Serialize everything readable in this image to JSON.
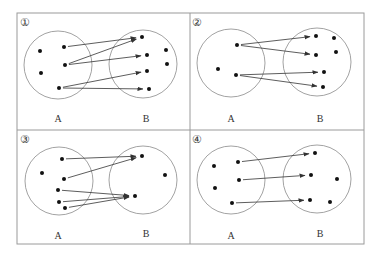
{
  "colors": {
    "frame": "#9a9a9a",
    "circle": "#8a8a8a",
    "dot": "#111111",
    "arrow": "#333333",
    "text": "#333333"
  },
  "frame": {
    "x": 17,
    "y": 13,
    "width": 347,
    "height": 231,
    "divider_x": 190,
    "divider_y": 130
  },
  "panels": [
    {
      "id": "panel-1",
      "number": "①",
      "number_pos": [
        25,
        23
      ],
      "set_a": {
        "label": "A",
        "label_pos": [
          58,
          120
        ],
        "circle": [
          58,
          65,
          34
        ],
        "points": [
          [
            40,
            51
          ],
          [
            64,
            47
          ],
          [
            41,
            73
          ],
          [
            65,
            65
          ],
          [
            59,
            88
          ]
        ]
      },
      "set_b": {
        "label": "B",
        "label_pos": [
          146,
          120
        ],
        "circle": [
          143,
          64,
          34
        ],
        "points": [
          [
            142,
            37
          ],
          [
            147,
            55
          ],
          [
            166,
            50
          ],
          [
            167,
            64
          ],
          [
            147,
            71
          ],
          [
            149,
            89
          ]
        ]
      },
      "arrows": [
        {
          "from": [
            64,
            47
          ],
          "to": [
            142,
            37
          ]
        },
        {
          "from": [
            65,
            65
          ],
          "to": [
            142,
            37
          ]
        },
        {
          "from": [
            65,
            65
          ],
          "to": [
            147,
            55
          ]
        },
        {
          "from": [
            59,
            88
          ],
          "to": [
            147,
            71
          ]
        },
        {
          "from": [
            59,
            88
          ],
          "to": [
            149,
            89
          ]
        }
      ]
    },
    {
      "id": "panel-2",
      "number": "②",
      "number_pos": [
        197,
        23
      ],
      "set_a": {
        "label": "A",
        "label_pos": [
          231,
          120
        ],
        "circle": [
          231,
          63,
          34
        ],
        "points": [
          [
            237,
            45
          ],
          [
            218,
            69
          ],
          [
            236,
            75
          ]
        ]
      },
      "set_b": {
        "label": "B",
        "label_pos": [
          320,
          120
        ],
        "circle": [
          317,
          62,
          34
        ],
        "points": [
          [
            316,
            36
          ],
          [
            334,
            38
          ],
          [
            336,
            52
          ],
          [
            316,
            55
          ],
          [
            324,
            72
          ],
          [
            323,
            87
          ]
        ]
      },
      "arrows": [
        {
          "from": [
            237,
            45
          ],
          "to": [
            316,
            36
          ]
        },
        {
          "from": [
            237,
            45
          ],
          "to": [
            316,
            55
          ]
        },
        {
          "from": [
            236,
            75
          ],
          "to": [
            324,
            72
          ]
        },
        {
          "from": [
            236,
            75
          ],
          "to": [
            323,
            87
          ]
        }
      ]
    },
    {
      "id": "panel-3",
      "number": "③",
      "number_pos": [
        25,
        140
      ],
      "set_a": {
        "label": "A",
        "label_pos": [
          58,
          237
        ],
        "circle": [
          59,
          181,
          34
        ],
        "points": [
          [
            62,
            159
          ],
          [
            42,
            173
          ],
          [
            64,
            179
          ],
          [
            58,
            190
          ],
          [
            59,
            202
          ],
          [
            65,
            208
          ]
        ]
      },
      "set_b": {
        "label": "B",
        "label_pos": [
          146,
          235
        ],
        "circle": [
          143,
          180,
          34
        ],
        "points": [
          [
            142,
            156
          ],
          [
            165,
            175
          ],
          [
            135,
            196
          ]
        ]
      },
      "arrows": [
        {
          "from": [
            62,
            159
          ],
          "to": [
            142,
            156
          ]
        },
        {
          "from": [
            64,
            179
          ],
          "to": [
            142,
            156
          ]
        },
        {
          "from": [
            58,
            190
          ],
          "to": [
            135,
            196
          ]
        },
        {
          "from": [
            59,
            202
          ],
          "to": [
            135,
            196
          ]
        },
        {
          "from": [
            65,
            208
          ],
          "to": [
            135,
            196
          ]
        }
      ]
    },
    {
      "id": "panel-4",
      "number": "④",
      "number_pos": [
        197,
        140
      ],
      "set_a": {
        "label": "A",
        "label_pos": [
          231,
          237
        ],
        "circle": [
          231,
          180,
          34
        ],
        "points": [
          [
            214,
            166
          ],
          [
            238,
            162
          ],
          [
            215,
            188
          ],
          [
            239,
            180
          ],
          [
            232,
            203
          ]
        ]
      },
      "set_b": {
        "label": "B",
        "label_pos": [
          320,
          235
        ],
        "circle": [
          317,
          179,
          34
        ],
        "points": [
          [
            315,
            153
          ],
          [
            311,
            175
          ],
          [
            337,
            179
          ],
          [
            310,
            200
          ],
          [
            330,
            202
          ]
        ]
      },
      "arrows": [
        {
          "from": [
            238,
            162
          ],
          "to": [
            315,
            153
          ]
        },
        {
          "from": [
            239,
            180
          ],
          "to": [
            311,
            175
          ]
        },
        {
          "from": [
            232,
            203
          ],
          "to": [
            310,
            200
          ]
        }
      ]
    }
  ]
}
